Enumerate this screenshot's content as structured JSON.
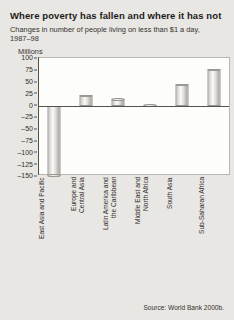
{
  "title": "Where poverty has fallen and where it has not",
  "subtitle": "Changes in number of people living on less than $1 a day, 1987–98",
  "source": "Source: World Bank 2000b.",
  "chart_data": {
    "type": "bar",
    "title": "Where poverty has fallen and where it has not",
    "subtitle": "Changes in number of people living on less than $1 a day, 1987–98",
    "xlabel": "",
    "ylabel": "Millions",
    "ylim": [
      -150,
      100
    ],
    "ytick_step": 25,
    "yticks": [
      100,
      75,
      50,
      25,
      0,
      -25,
      -50,
      -75,
      -100,
      -125,
      -150
    ],
    "ytick_labels": [
      "100",
      "75",
      "50",
      "25",
      "0",
      "–25",
      "–50",
      "–75",
      "–100",
      "–125",
      "–150"
    ],
    "grid": false,
    "legend": "none",
    "categories": [
      "East Asia and Pacific",
      "Europe and\nCentral Asia",
      "Latin America and\nthe Caribbean",
      "Middle East and\nNorth Africa",
      "South Asia",
      "Sub-Saharan Africa"
    ],
    "values": [
      -150,
      22,
      14,
      2,
      45,
      77
    ],
    "source": "Source: World Bank 2000b."
  }
}
